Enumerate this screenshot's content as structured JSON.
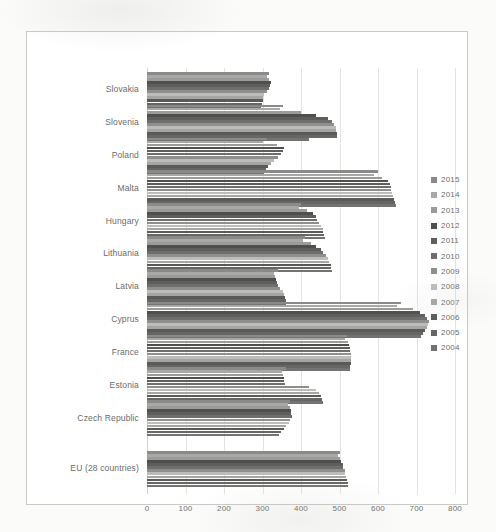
{
  "chart_data": {
    "type": "bar",
    "orientation": "horizontal",
    "title": "",
    "subtitle": "",
    "xlabel": "",
    "ylabel": "",
    "xlim": [
      0,
      800
    ],
    "xticks": [
      "0",
      "100",
      "200",
      "300",
      "400",
      "500",
      "600",
      "700",
      "800"
    ],
    "xtick_values": [
      0,
      100,
      200,
      300,
      400,
      500,
      600,
      700,
      800
    ],
    "grid": true,
    "legend_position": "right",
    "categories": [
      "Slovakia",
      "Slovenia",
      "Poland",
      "Malta",
      "Hungary",
      "Lithuania",
      "Latvia",
      "Cyprus",
      "France",
      "Estonia",
      "Czech Republic",
      "EU (28 countries)"
    ],
    "series": [
      {
        "name": "2015",
        "color": "#8a8a88",
        "values": [
          318,
          352,
          312,
          600,
          400,
          410,
          340,
          660,
          520,
          360,
          372,
          500
        ]
      },
      {
        "name": "2014",
        "color": "#a8a8a6",
        "values": [
          312,
          345,
          300,
          590,
          395,
          405,
          330,
          650,
          515,
          350,
          365,
          495
        ]
      },
      {
        "name": "2013",
        "color": "#9b9b99",
        "values": [
          316,
          400,
          338,
          610,
          415,
          425,
          333,
          690,
          522,
          352,
          372,
          500
        ]
      },
      {
        "name": "2012",
        "color": "#4f4f4d",
        "values": [
          322,
          440,
          355,
          625,
          430,
          440,
          336,
          710,
          525,
          355,
          374,
          505
        ]
      },
      {
        "name": "2011",
        "color": "#5e5e5c",
        "values": [
          320,
          470,
          352,
          630,
          438,
          452,
          338,
          722,
          527,
          356,
          375,
          508
        ]
      },
      {
        "name": "2010",
        "color": "#6e6e6c",
        "values": [
          318,
          480,
          348,
          633,
          442,
          458,
          340,
          728,
          528,
          358,
          376,
          510
        ]
      },
      {
        "name": "2009",
        "color": "#8f8f8d",
        "values": [
          312,
          487,
          340,
          635,
          448,
          465,
          345,
          733,
          530,
          420,
          372,
          513
        ]
      },
      {
        "name": "2008",
        "color": "#bcbcba",
        "values": [
          305,
          490,
          330,
          637,
          452,
          470,
          352,
          730,
          531,
          438,
          368,
          515
        ]
      },
      {
        "name": "2007",
        "color": "#a5a5a3",
        "values": [
          302,
          492,
          322,
          640,
          456,
          474,
          356,
          726,
          530,
          448,
          362,
          518
        ]
      },
      {
        "name": "2006",
        "color": "#5a5a58",
        "values": [
          300,
          493,
          314,
          642,
          458,
          477,
          358,
          722,
          529,
          452,
          356,
          520
        ]
      },
      {
        "name": "2005",
        "color": "#666664",
        "values": [
          298,
          494,
          308,
          644,
          460,
          479,
          360,
          718,
          528,
          455,
          348,
          522
        ]
      },
      {
        "name": "2004",
        "color": "#737371",
        "values": [
          296,
          420,
          304,
          646,
          462,
          480,
          362,
          712,
          527,
          456,
          342,
          523
        ]
      }
    ]
  },
  "legend": {
    "items": [
      {
        "label": "2015"
      },
      {
        "label": "2014"
      },
      {
        "label": "2013"
      },
      {
        "label": "2012"
      },
      {
        "label": "2011"
      },
      {
        "label": "2010"
      },
      {
        "label": "2009"
      },
      {
        "label": "2008"
      },
      {
        "label": "2007"
      },
      {
        "label": "2006"
      },
      {
        "label": "2005"
      },
      {
        "label": "2004"
      }
    ]
  }
}
